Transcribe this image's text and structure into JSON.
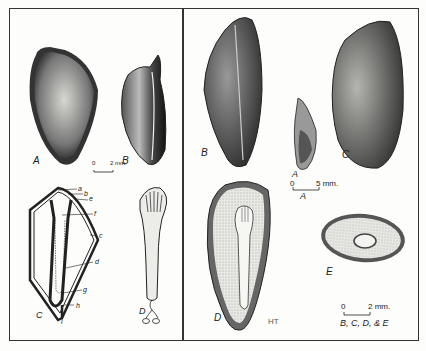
{
  "figure": {
    "left_panel": {
      "labels": {
        "A": "A",
        "B": "B",
        "C": "C",
        "D": "D"
      },
      "part_labels": [
        "a",
        "b",
        "e",
        "f",
        "c",
        "d",
        "g",
        "h",
        "i"
      ],
      "scale": {
        "zero": "0",
        "value": "2 mm."
      }
    },
    "right_panel": {
      "labels": {
        "A": "A",
        "B": "B",
        "C": "C",
        "D": "D",
        "E": "E"
      },
      "scale_A": {
        "zero": "0",
        "value": "5 mm.",
        "caption": "A"
      },
      "scale_BCDE": {
        "zero": "0",
        "value": "2 mm.",
        "caption": "B, C, D, & E"
      },
      "signature": "HT"
    }
  }
}
